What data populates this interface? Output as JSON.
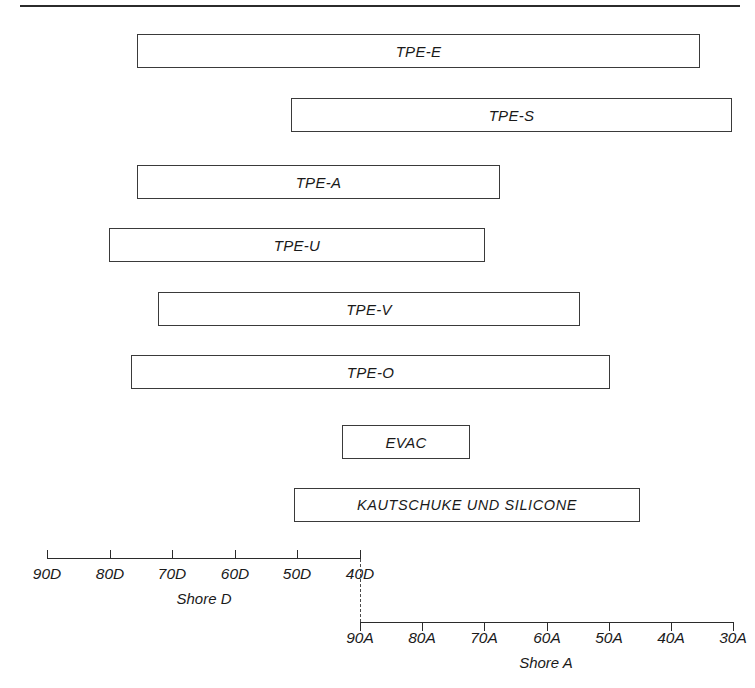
{
  "chart_data": {
    "type": "bar",
    "orientation": "horizontal",
    "title": "",
    "subtitle": "",
    "xlabel": "",
    "ylabel": "",
    "grid": false,
    "legend": null,
    "axes": [
      {
        "name": "Shore D",
        "caption": "Shore D",
        "ticks": [
          "90D",
          "80D",
          "70D",
          "60D",
          "50D",
          "40D"
        ],
        "values": [
          90,
          80,
          70,
          60,
          50,
          40
        ],
        "range": [
          90,
          40
        ],
        "direction": "decreasing",
        "position": "upper-left",
        "tick_direction": "up",
        "px_start": 47,
        "px_end": 360
      },
      {
        "name": "Shore A",
        "caption": "Shore A",
        "ticks": [
          "90A",
          "80A",
          "70A",
          "60A",
          "50A",
          "40A",
          "30A"
        ],
        "values": [
          90,
          80,
          70,
          60,
          50,
          40,
          30
        ],
        "range": [
          90,
          30
        ],
        "direction": "decreasing",
        "position": "lower-right",
        "tick_direction": "down",
        "px_start": 360,
        "px_end": 733
      }
    ],
    "connector": {
      "style": "dashed",
      "from_tick": "40D",
      "to_tick": "90A"
    },
    "categories": [
      "TPE-E",
      "TPE-S",
      "TPE-A",
      "TPE-U",
      "TPE-V",
      "TPE-O",
      "EVAC",
      "KAUTSCHUKE UND SILICONE"
    ],
    "bars": [
      {
        "label": "TPE-E",
        "start": "72D",
        "end": "48A",
        "px_left": 137,
        "px_right": 700,
        "px_top": 34
      },
      {
        "label": "TPE-S",
        "start": "48D",
        "end": "30A",
        "px_left": 291,
        "px_right": 732,
        "px_top": 98
      },
      {
        "label": "TPE-A",
        "start": "72D",
        "end": "68A",
        "px_left": 137,
        "px_right": 500,
        "px_top": 165
      },
      {
        "label": "TPE-U",
        "start": "76D",
        "end": "70A",
        "px_left": 109,
        "px_right": 485,
        "px_top": 228
      },
      {
        "label": "TPE-V",
        "start": "68D",
        "end": "55A",
        "px_left": 158,
        "px_right": 580,
        "px_top": 292
      },
      {
        "label": "TPE-O",
        "start": "73D",
        "end": "50A",
        "px_left": 131,
        "px_right": 610,
        "px_top": 355
      },
      {
        "label": "EVAC",
        "start": "90A",
        "end": "72A",
        "px_left": 342,
        "px_right": 470,
        "px_top": 425
      },
      {
        "label": "KAUTSCHUKE UND SILICONE",
        "start": "41D",
        "end": "45A",
        "px_left": 294,
        "px_right": 640,
        "px_top": 488
      }
    ]
  },
  "colors": {
    "background": "#ffffff",
    "bar_fill": "#ffffff",
    "bar_border": "#3a3a3a",
    "axis": "#2b2b2b",
    "text": "#1a1a1a",
    "rule": "#2b2b2b"
  }
}
